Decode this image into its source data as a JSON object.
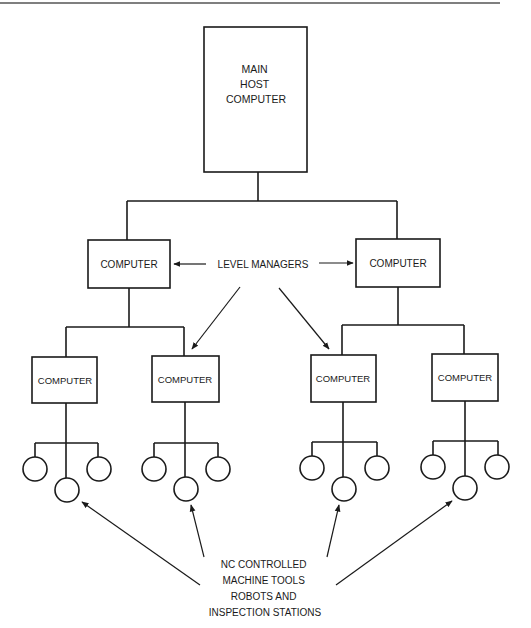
{
  "diagram": {
    "main_host": {
      "lines": [
        "MAIN",
        "HOST",
        "COMPUTER"
      ]
    },
    "level_managers_label": "LEVEL MANAGERS",
    "level2": [
      {
        "label": "COMPUTER"
      },
      {
        "label": "COMPUTER"
      }
    ],
    "level3": [
      {
        "label": "COMPUTER"
      },
      {
        "label": "COMPUTER"
      },
      {
        "label": "COMPUTER"
      },
      {
        "label": "COMPUTER"
      }
    ],
    "devices_per_node": 3,
    "devices_label": {
      "lines": [
        "NC CONTROLLED",
        "MACHINE TOOLS",
        "ROBOTS AND",
        "INSPECTION STATIONS"
      ]
    },
    "colors": {
      "stroke": "#1a1a1a",
      "background": "#ffffff"
    }
  }
}
